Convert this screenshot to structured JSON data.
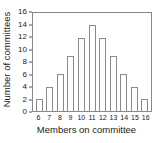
{
  "chart_data": {
    "type": "bar",
    "title": "",
    "subtitle": "",
    "xlabel": "Members on committee",
    "ylabel": "Number of committees",
    "categories": [
      "6",
      "7",
      "8",
      "9",
      "10",
      "11",
      "12",
      "13",
      "14",
      "15",
      "16"
    ],
    "values": [
      2,
      4,
      6,
      9,
      12,
      14,
      12,
      9,
      6,
      4,
      2
    ],
    "ylim": [
      0,
      16
    ],
    "ytick_labels": [
      "0",
      "2",
      "4",
      "6",
      "8",
      "10",
      "12",
      "14",
      "16"
    ],
    "ytick_values": [
      0,
      2,
      4,
      6,
      8,
      10,
      12,
      14,
      16
    ],
    "xlim_labels": [
      "6",
      "16"
    ],
    "grid": false,
    "legend": null,
    "legend_position": "none",
    "bar_fill_color": "#ffffff",
    "bar_edge_color": "#8a8a8a",
    "axis_color": "#8a8a8a",
    "text_color": "#1a1a1a",
    "background_color": "#ffffff",
    "annotations": []
  }
}
